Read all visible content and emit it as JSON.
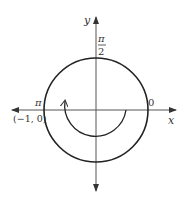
{
  "diagram": {
    "type": "unit-circle",
    "axes": {
      "x_label": "x",
      "y_label": "y"
    },
    "angle_labels": {
      "top": {
        "numerator": "π",
        "denominator": "2"
      },
      "left": "π",
      "right": "0"
    },
    "point_label": "(−1, 0)",
    "arc": {
      "from_angle": "0",
      "to_angle": "π",
      "direction": "clockwise"
    },
    "colors": {
      "stroke": "#222222",
      "axis": "#666666"
    }
  }
}
